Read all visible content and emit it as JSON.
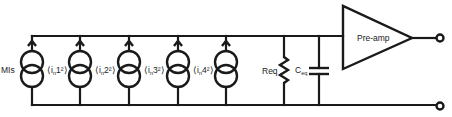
{
  "diagram": {
    "type": "noise equivalent circuit",
    "current_sources": [
      {
        "label_main": "MIs",
        "label_pre": "",
        "label_sub": "",
        "label_sup": "",
        "label_post": "",
        "side": "left"
      },
      {
        "label_main": "",
        "label_pre": "⟨i",
        "label_sub": "n",
        "label_sup": "1²",
        "label_post": "⟩",
        "side": "right"
      },
      {
        "label_main": "",
        "label_pre": "⟨i",
        "label_sub": "n",
        "label_sup": "2²",
        "label_post": "⟩",
        "side": "right"
      },
      {
        "label_main": "",
        "label_pre": "⟨i",
        "label_sub": "n",
        "label_sup": "3²",
        "label_post": "⟩",
        "side": "right"
      },
      {
        "label_main": "",
        "label_pre": "⟨i",
        "label_sub": "n",
        "label_sup": "4²",
        "label_post": "⟩",
        "side": "right"
      }
    ],
    "resistor": {
      "label": "Req"
    },
    "capacitor": {
      "label_main": "C",
      "label_sub": "eq"
    },
    "amplifier": {
      "label": "Pre-amp"
    },
    "terminals": [
      "output-top",
      "output-bottom"
    ]
  }
}
